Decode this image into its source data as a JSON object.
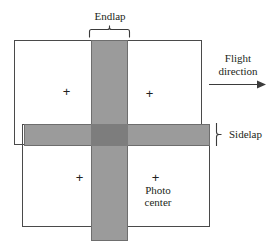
{
  "diagram": {
    "labels": {
      "endlap": "Endlap",
      "sidelap": "Sidelap",
      "flight_direction": "Flight direction",
      "flight_direction_line1": "Flight",
      "flight_direction_line2": "direction",
      "photo_center": "Photo center",
      "photo_center_line1": "Photo",
      "photo_center_line2": "center"
    },
    "marks": {
      "plus": "+"
    },
    "colors": {
      "background": "#ffffff",
      "frame_stroke": "#4a4a4a",
      "overlap_fill": "#9b9b9b",
      "overlap_stroke": "#6e6e6e",
      "intersection_fill": "#7d7d7d",
      "text": "#231f20"
    },
    "frames": [
      {
        "name": "top-left-photo",
        "x": 14,
        "y": 40,
        "w": 188,
        "h": 105
      },
      {
        "name": "bottom-right-photo",
        "x": 22,
        "y": 124,
        "w": 188,
        "h": 103
      }
    ],
    "bands": [
      {
        "name": "endlap-band",
        "orientation": "vertical",
        "x": 91,
        "y": 40,
        "w": 37,
        "h": 201
      },
      {
        "name": "sidelap-band",
        "orientation": "horizontal",
        "x": 24,
        "y": 124,
        "w": 186,
        "h": 22
      }
    ],
    "photo_centers": [
      {
        "name": "top-left",
        "x": 66,
        "y": 91
      },
      {
        "name": "top-right",
        "x": 149,
        "y": 93
      },
      {
        "name": "bottom-left",
        "x": 79,
        "y": 177
      },
      {
        "name": "bottom-right",
        "x": 155,
        "y": 177
      }
    ]
  }
}
